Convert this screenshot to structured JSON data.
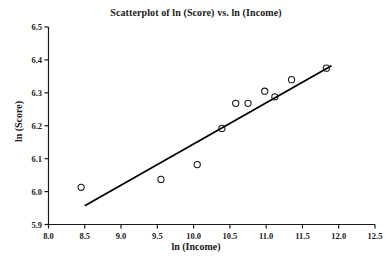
{
  "chart_data": {
    "type": "scatter",
    "title": "Scatterplot of ln (Score) vs. ln (Income)",
    "xlabel": "ln (Income)",
    "ylabel": "ln (Score)",
    "xlim": [
      8.0,
      12.5
    ],
    "ylim": [
      5.9,
      6.5
    ],
    "xticks": [
      "8.0",
      "8.5",
      "9.0",
      "9.5",
      "10.0",
      "10.5",
      "11.0",
      "11.5",
      "12.0",
      "12.5"
    ],
    "xtick_values": [
      8.0,
      8.5,
      9.0,
      9.5,
      10.0,
      10.5,
      11.0,
      11.5,
      12.0,
      12.5
    ],
    "yticks": [
      "5.9",
      "6.0",
      "6.1",
      "6.2",
      "6.3",
      "6.4",
      "6.5"
    ],
    "ytick_values": [
      5.9,
      6.0,
      6.1,
      6.2,
      6.3,
      6.4,
      6.5
    ],
    "grid": false,
    "legend": false,
    "marker": "open-circle",
    "marker_color": "#1a1a1a",
    "line_color": "#000000",
    "points": [
      {
        "x": 8.45,
        "y": 6.013
      },
      {
        "x": 9.55,
        "y": 6.037
      },
      {
        "x": 10.05,
        "y": 6.082
      },
      {
        "x": 10.39,
        "y": 6.192
      },
      {
        "x": 10.58,
        "y": 6.268
      },
      {
        "x": 10.75,
        "y": 6.268
      },
      {
        "x": 10.98,
        "y": 6.305
      },
      {
        "x": 11.12,
        "y": 6.288
      },
      {
        "x": 11.35,
        "y": 6.34
      },
      {
        "x": 11.83,
        "y": 6.375
      }
    ],
    "fit_line": {
      "name": "regression-line",
      "x_start": 8.5,
      "y_start": 5.957,
      "x_end": 11.9,
      "y_end": 6.382
    }
  }
}
